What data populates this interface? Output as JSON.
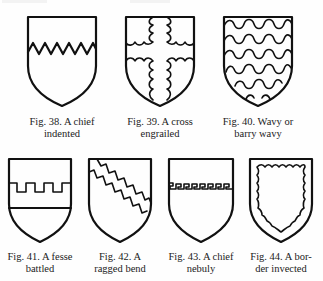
{
  "figures": [
    {
      "id": "fig-38",
      "line1": "Fig. 38.  A chief",
      "line2": "indented",
      "charge": "chief indented"
    },
    {
      "id": "fig-39",
      "line1": "Fig. 39.  A cross",
      "line2": "engrailed",
      "charge": "cross engrailed"
    },
    {
      "id": "fig-40",
      "line1": "Fig. 40.  Wavy or",
      "line2": "barry wavy",
      "charge": "barry wavy"
    },
    {
      "id": "fig-41",
      "line1": "Fig. 41.  A fesse",
      "line2": "battled",
      "charge": "fesse battled"
    },
    {
      "id": "fig-42",
      "line1": "Fig. 42.  A",
      "line2": "ragged bend",
      "charge": "ragged bend"
    },
    {
      "id": "fig-43",
      "line1": "Fig. 43.  A chief",
      "line2": "nebuly",
      "charge": "chief nebuly"
    },
    {
      "id": "fig-44",
      "line1": "Fig. 44.  A bor-",
      "line2": "der invected",
      "charge": "border invected"
    }
  ]
}
